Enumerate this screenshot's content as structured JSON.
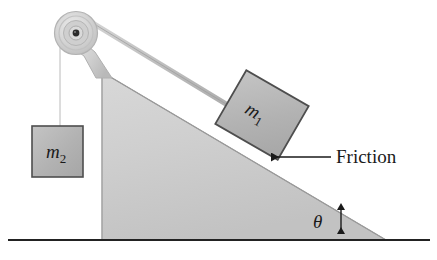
{
  "figure": {
    "type": "physics-free-body-diagram",
    "width": 437,
    "height": 260,
    "background_color": "#ffffff"
  },
  "labels": {
    "mass_hanging": {
      "symbol": "m",
      "subscript": "2"
    },
    "mass_incline": {
      "symbol": "m",
      "subscript": "1"
    },
    "angle": "θ",
    "friction": "Friction"
  },
  "colors": {
    "incline_fill": "#c9c9c9",
    "incline_fill_light": "#dcdcdc",
    "incline_stroke": "#8d8d8d",
    "block_fill": "#b4b4b4",
    "block_stroke": "#4a4a4a",
    "rope": "#b8b8b8",
    "rope_stroke": "#9a9a9a",
    "pulley_outer": "#d2d2d2",
    "pulley_mid": "#bdbdbd",
    "pulley_hub": "#cccccc",
    "pulley_axle": "#2b2b2b",
    "bracket": "#d8d8d8",
    "ground_line": "#222222",
    "text": "#1a1a1a",
    "arrow": "#1a1a1a"
  },
  "geometry": {
    "ground_line": {
      "x1": 8,
      "y1": 240,
      "x2": 430,
      "y2": 240
    },
    "incline_triangle": {
      "apex": [
        102,
        72
      ],
      "base_left": [
        102,
        240
      ],
      "base_right": [
        386,
        240
      ]
    },
    "incline_angle_degrees": 30,
    "pulley": {
      "cx": 76,
      "cy": 33,
      "r_outer": 21,
      "r_mid": 14,
      "r_hub": 8,
      "r_axle": 3
    },
    "rope_vertical": {
      "x": 60,
      "y_top": 33,
      "y_bottom": 126
    },
    "rope_incline": {
      "x1": 88,
      "y1": 19,
      "x2": 252,
      "y2": 120
    },
    "block_m2": {
      "x": 32,
      "y": 126,
      "width": 51,
      "height": 51
    },
    "block_m1": {
      "cx": 262,
      "cy": 115,
      "width": 72,
      "height": 62,
      "rotation_degrees": 29
    },
    "friction_arrow": {
      "tip": [
        269,
        157
      ],
      "tail": [
        330,
        157
      ]
    },
    "theta_arrow": {
      "x": 341,
      "y_top": 205,
      "y_bottom": 238
    }
  }
}
